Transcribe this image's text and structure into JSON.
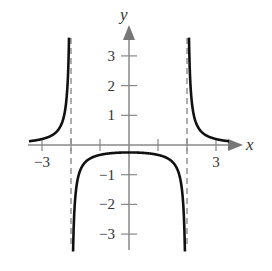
{
  "chart_data": {
    "type": "line",
    "title": "",
    "function": "y = 1/(x^2 - 4)",
    "xlabel": "x",
    "ylabel": "y",
    "xlim": [
      -3.5,
      3.6
    ],
    "ylim": [
      -3.6,
      3.8
    ],
    "x_ticks": [
      -3,
      -2,
      -1,
      1,
      2,
      3
    ],
    "x_tick_labels": [
      {
        "value": -3,
        "label": "−3"
      },
      {
        "value": 3,
        "label": "3"
      }
    ],
    "y_ticks": [
      -3,
      -2,
      -1,
      1,
      2,
      3
    ],
    "y_tick_labels": [
      {
        "value": 3,
        "label": "3"
      },
      {
        "value": 2,
        "label": "2"
      },
      {
        "value": 1,
        "label": "1"
      },
      {
        "value": -1,
        "label": "−1"
      },
      {
        "value": -2,
        "label": "−2"
      },
      {
        "value": -3,
        "label": "−3"
      }
    ],
    "asymptotes": {
      "vertical": [
        -2,
        2
      ],
      "horizontal": [
        0
      ],
      "style": "dashed"
    },
    "series": [
      {
        "name": "left branch",
        "x": [
          -3.4,
          -3,
          -2.5,
          -2.2,
          -2.1,
          -2.07
        ],
        "y": [
          0.13,
          0.2,
          0.44,
          1.19,
          2.44,
          3.5
        ]
      },
      {
        "name": "middle branch",
        "x": [
          -1.93,
          -1.8,
          -1.5,
          -1,
          0,
          1,
          1.5,
          1.8,
          1.93
        ],
        "y": [
          -3.6,
          -1.32,
          -0.57,
          -0.33,
          -0.25,
          -0.33,
          -0.57,
          -1.32,
          -3.6
        ]
      },
      {
        "name": "right branch",
        "x": [
          2.07,
          2.1,
          2.2,
          2.5,
          3,
          3.4
        ],
        "y": [
          3.5,
          2.44,
          1.19,
          0.44,
          0.2,
          0.13
        ]
      }
    ],
    "grid": false,
    "legend": null
  },
  "labels": {
    "x_axis": "x",
    "y_axis": "y"
  }
}
